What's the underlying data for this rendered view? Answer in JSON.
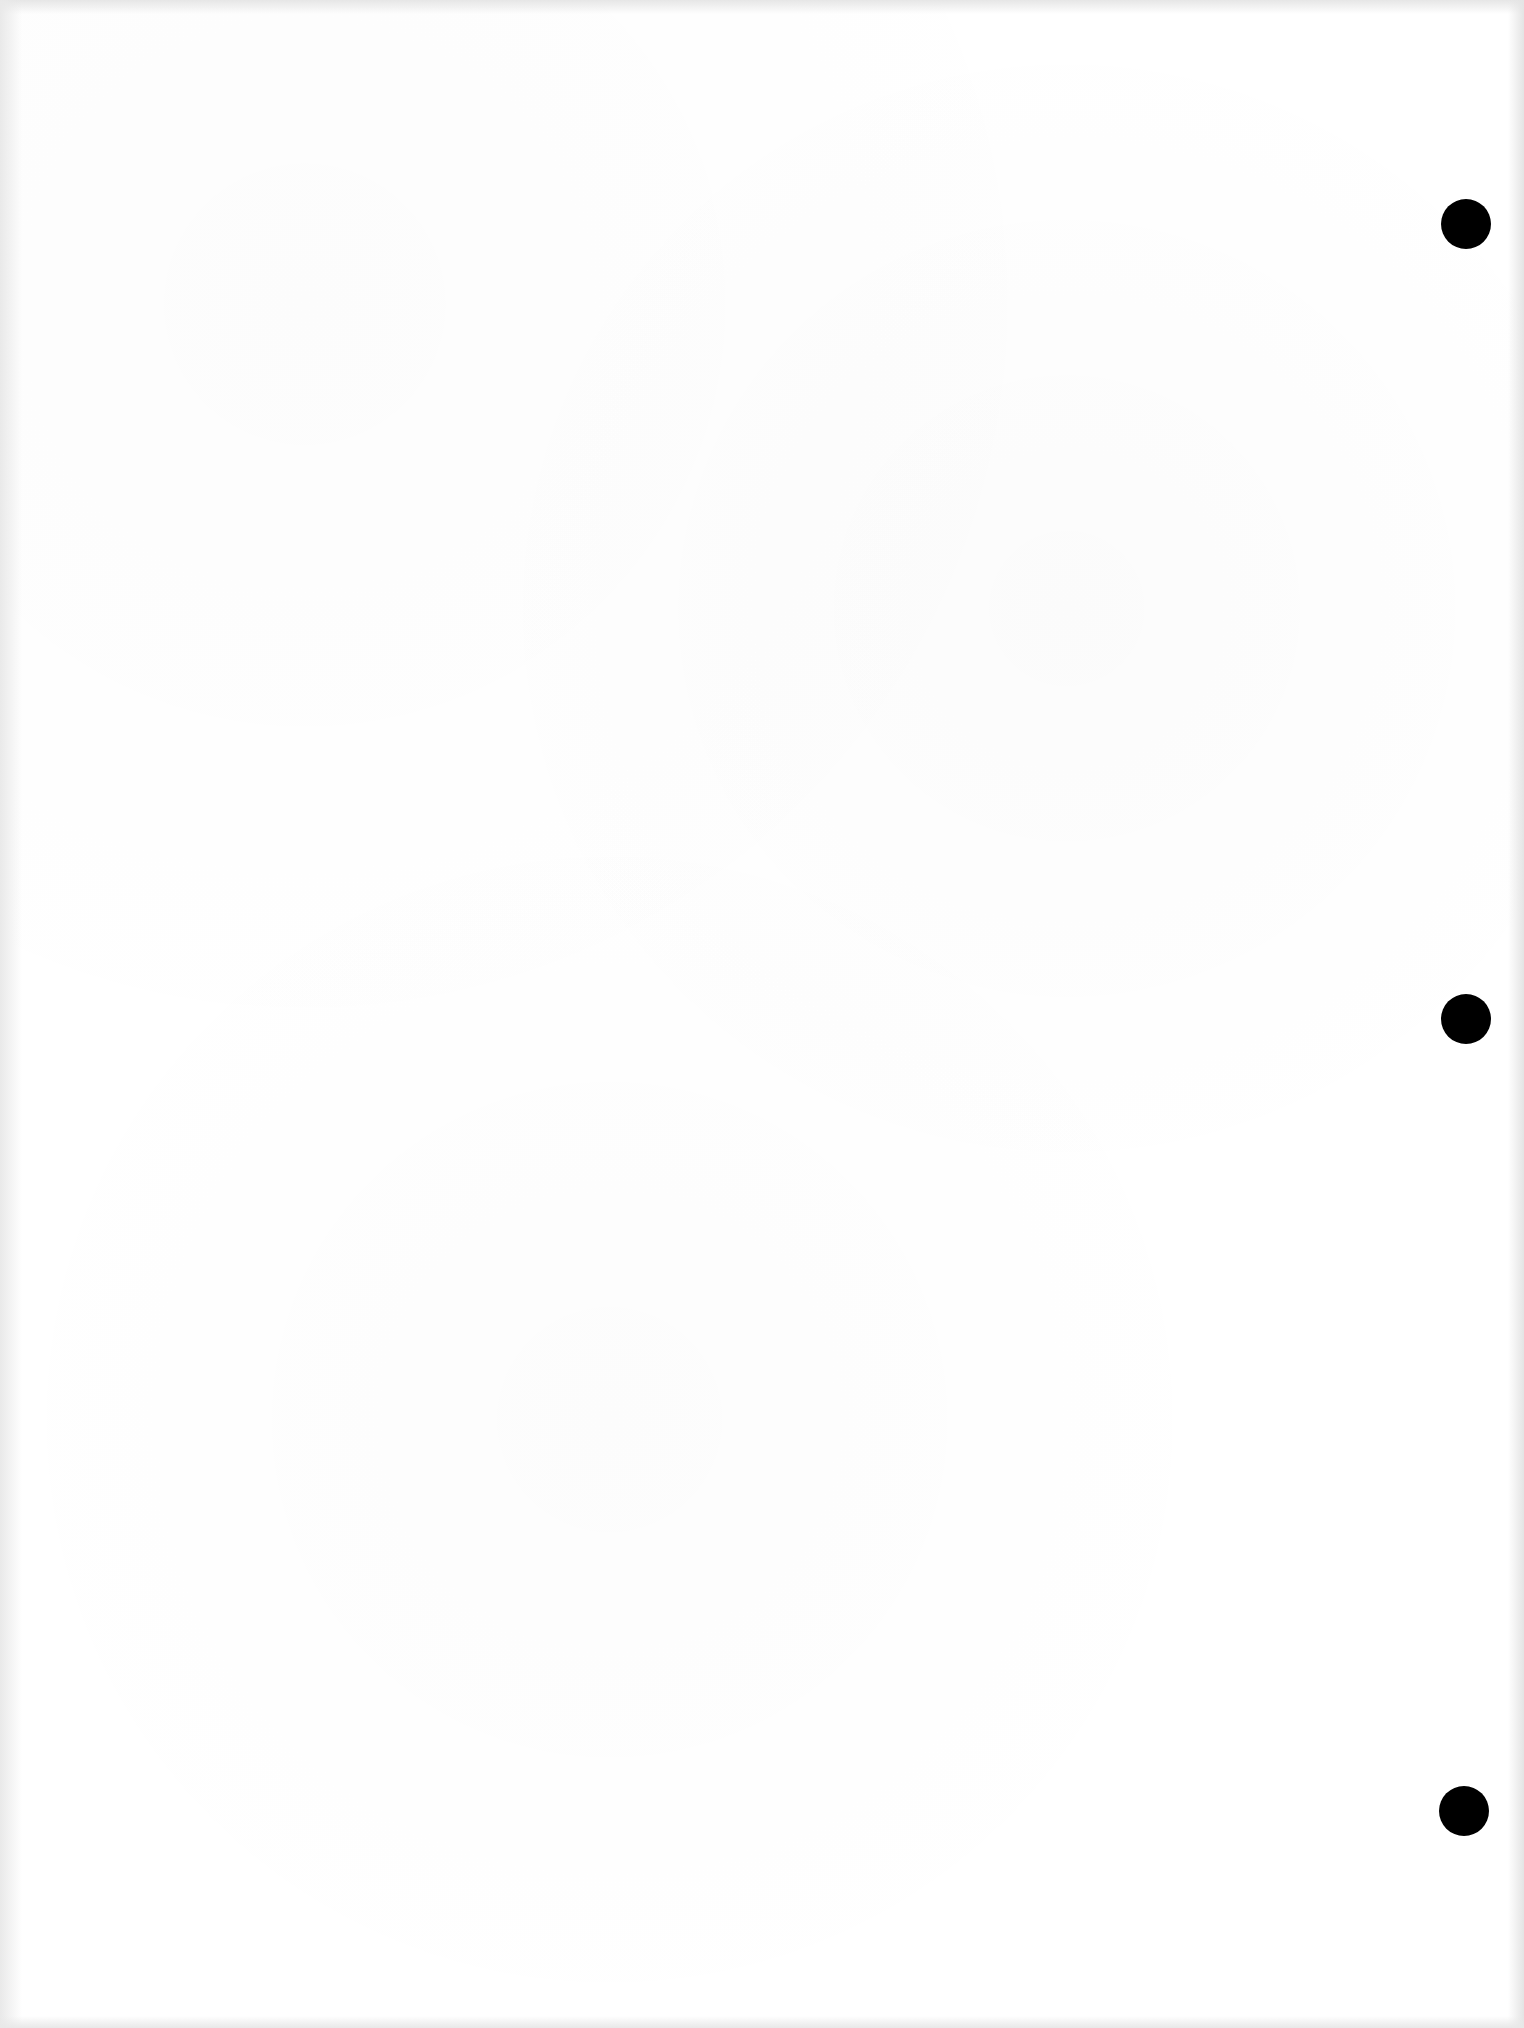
{
  "document": {
    "type": "blank scanned page",
    "paper_color": "#ffffff",
    "text_content": ""
  },
  "punch_holes": [
    {
      "name": "punch-hole-top",
      "x": 1466,
      "y": 224,
      "diameter": 50,
      "color": "#000000"
    },
    {
      "name": "punch-hole-middle",
      "x": 1466,
      "y": 1019,
      "diameter": 50,
      "color": "#000000"
    },
    {
      "name": "punch-hole-bottom",
      "x": 1464,
      "y": 1811,
      "diameter": 50,
      "color": "#000000"
    }
  ]
}
